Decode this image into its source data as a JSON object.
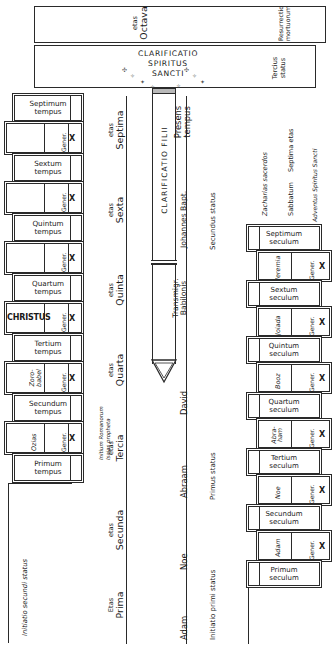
{
  "diagram": {
    "ink_color": "#2a2a2a",
    "paper_color": "#ffffff"
  },
  "banners": [
    {
      "name": "etas-octava",
      "etas_small": "etas",
      "etas_big": "Octava",
      "right_label": "Resurrectio mortuorum"
    },
    {
      "name": "clarificatio-spiritus-sancti",
      "line1": "CLARIFICATIO",
      "line2": "SPIRITUS",
      "line3": "SANCTI",
      "right_label": "Tercius status"
    }
  ],
  "vessel": {
    "label": "CLARIFICATIO FILII"
  },
  "left_ladder": {
    "title": "tempora",
    "bottom_label": "Initiatio secundi status",
    "side_note": "Initium Romanorum Isaias propheta",
    "gener_label": "Gener.",
    "gener_count": "X",
    "tempora": [
      {
        "ordinal": "Septimum",
        "unit": "tempus"
      },
      {
        "ordinal": "Sextum",
        "unit": "tempus"
      },
      {
        "ordinal": "Quintum",
        "unit": "tempus"
      },
      {
        "ordinal": "Quartum",
        "unit": "tempus"
      },
      {
        "ordinal": "Tertium",
        "unit": "tempus"
      },
      {
        "ordinal": "Secundum",
        "unit": "tempus"
      },
      {
        "ordinal": "Primum",
        "unit": "tempus"
      }
    ],
    "generations": [
      {
        "person": ""
      },
      {
        "person": ""
      },
      {
        "person": ""
      },
      {
        "person": "CHRISTUS"
      },
      {
        "person": "Zoro-babel"
      },
      {
        "person": "Ozias"
      }
    ]
  },
  "right_ladder": {
    "title": "secula",
    "gener_label": "Gener.",
    "gener_count": "X",
    "secula": [
      {
        "ordinal": "Septimum",
        "unit": "seculum"
      },
      {
        "ordinal": "Sextum",
        "unit": "seculum"
      },
      {
        "ordinal": "Quintum",
        "unit": "seculum"
      },
      {
        "ordinal": "Quartum",
        "unit": "seculum"
      },
      {
        "ordinal": "Tertium",
        "unit": "seculum"
      },
      {
        "ordinal": "Secundum",
        "unit": "seculum"
      },
      {
        "ordinal": "Primum",
        "unit": "seculum"
      }
    ],
    "generations": [
      {
        "person": "Jeremia"
      },
      {
        "person": "Joiada"
      },
      {
        "person": "Booz"
      },
      {
        "person": "Abra-ham"
      },
      {
        "person": "Noe"
      },
      {
        "person": "Adam"
      }
    ],
    "top_notes": [
      "Zacharias sacerdos",
      "Sabbatum",
      "Septima etas",
      "Adventus Spiritus Sancti"
    ]
  },
  "etates_axis": {
    "items": [
      {
        "small": "etas",
        "big": "Septima"
      },
      {
        "small": "etas",
        "big": "Sexta"
      },
      {
        "small": "etas",
        "big": "Quinta"
      },
      {
        "small": "etas",
        "big": "Quarta"
      },
      {
        "small": "etas",
        "big": "Tercia"
      },
      {
        "small": "etas",
        "big": "Secunda"
      },
      {
        "small": "Etas",
        "big": "Prima"
      }
    ]
  },
  "events_axis": {
    "items": [
      "Presens tempus",
      "Johannes Bapt.",
      "Transmigr. Babilonis",
      "David",
      "Abraam",
      "Noe",
      "Adam"
    ]
  },
  "status_axis": {
    "items": [
      "Secundus status",
      "Primus status",
      "Initiatio primi status"
    ]
  }
}
